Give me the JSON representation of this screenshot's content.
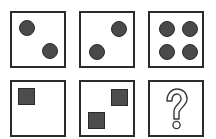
{
  "puzzle": {
    "title": "",
    "rows": [
      {
        "shape": "circle",
        "cells": [
          {
            "count": 2,
            "positions": [
              "top-left",
              "bottom-right"
            ]
          },
          {
            "count": 2,
            "positions": [
              "top-right",
              "bottom-left"
            ]
          },
          {
            "count": 4,
            "positions": [
              "top-left",
              "top-right",
              "bottom-left",
              "bottom-right"
            ]
          }
        ]
      },
      {
        "shape": "square",
        "cells": [
          {
            "count": 1,
            "positions": [
              "top-left"
            ]
          },
          {
            "count": 2,
            "positions": [
              "top-right",
              "bottom-left"
            ]
          },
          {
            "count": null,
            "label": "?",
            "icon": "question-mark-icon"
          }
        ]
      }
    ],
    "colors": {
      "shape_fill": "#4a4a4a",
      "border": "#2b2b2b",
      "background": "#ffffff"
    }
  }
}
